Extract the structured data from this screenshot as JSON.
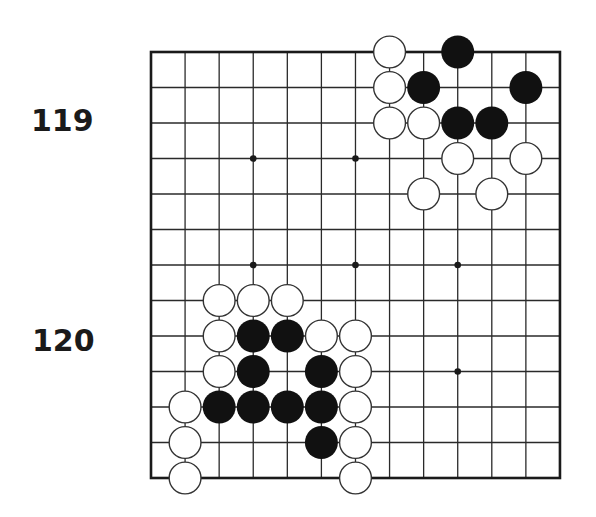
{
  "labels": [
    {
      "id": "119",
      "text": "119"
    },
    {
      "id": "120",
      "text": "120"
    }
  ],
  "board": {
    "columns": 13,
    "rows": 13,
    "origin_x": 151,
    "origin_y": 52,
    "spacing_x": 34.08,
    "spacing_y": 35.5,
    "stone_radius": 16.5,
    "line_color": "#2a2a2a",
    "edge_color": "#1a1a1a",
    "black_color": "#111111",
    "white_fill": "#ffffff",
    "white_stroke": "#333333",
    "star_points": [
      {
        "col": 3,
        "row": 3
      },
      {
        "col": 6,
        "row": 3
      },
      {
        "col": 3,
        "row": 6
      },
      {
        "col": 6,
        "row": 6
      },
      {
        "col": 9,
        "row": 6
      },
      {
        "col": 9,
        "row": 9
      }
    ],
    "stones": [
      {
        "color": "white",
        "col": 7,
        "row": 0
      },
      {
        "color": "black",
        "col": 9,
        "row": 0
      },
      {
        "color": "white",
        "col": 7,
        "row": 1
      },
      {
        "color": "black",
        "col": 8,
        "row": 1
      },
      {
        "color": "black",
        "col": 11,
        "row": 1
      },
      {
        "color": "white",
        "col": 7,
        "row": 2
      },
      {
        "color": "white",
        "col": 8,
        "row": 2
      },
      {
        "color": "black",
        "col": 9,
        "row": 2
      },
      {
        "color": "black",
        "col": 10,
        "row": 2
      },
      {
        "color": "white",
        "col": 9,
        "row": 3
      },
      {
        "color": "white",
        "col": 11,
        "row": 3
      },
      {
        "color": "white",
        "col": 8,
        "row": 4
      },
      {
        "color": "white",
        "col": 10,
        "row": 4
      },
      {
        "color": "white",
        "col": 2,
        "row": 7
      },
      {
        "color": "white",
        "col": 3,
        "row": 7
      },
      {
        "color": "white",
        "col": 4,
        "row": 7
      },
      {
        "color": "white",
        "col": 2,
        "row": 8
      },
      {
        "color": "black",
        "col": 3,
        "row": 8
      },
      {
        "color": "black",
        "col": 4,
        "row": 8
      },
      {
        "color": "white",
        "col": 5,
        "row": 8
      },
      {
        "color": "white",
        "col": 6,
        "row": 8
      },
      {
        "color": "white",
        "col": 2,
        "row": 9
      },
      {
        "color": "black",
        "col": 3,
        "row": 9
      },
      {
        "color": "black",
        "col": 5,
        "row": 9
      },
      {
        "color": "white",
        "col": 6,
        "row": 9
      },
      {
        "color": "white",
        "col": 1,
        "row": 10
      },
      {
        "color": "black",
        "col": 2,
        "row": 10
      },
      {
        "color": "black",
        "col": 3,
        "row": 10
      },
      {
        "color": "black",
        "col": 4,
        "row": 10
      },
      {
        "color": "black",
        "col": 5,
        "row": 10
      },
      {
        "color": "white",
        "col": 6,
        "row": 10
      },
      {
        "color": "white",
        "col": 1,
        "row": 11
      },
      {
        "color": "black",
        "col": 5,
        "row": 11
      },
      {
        "color": "white",
        "col": 6,
        "row": 11
      },
      {
        "color": "white",
        "col": 1,
        "row": 12
      },
      {
        "color": "white",
        "col": 6,
        "row": 12
      }
    ]
  }
}
